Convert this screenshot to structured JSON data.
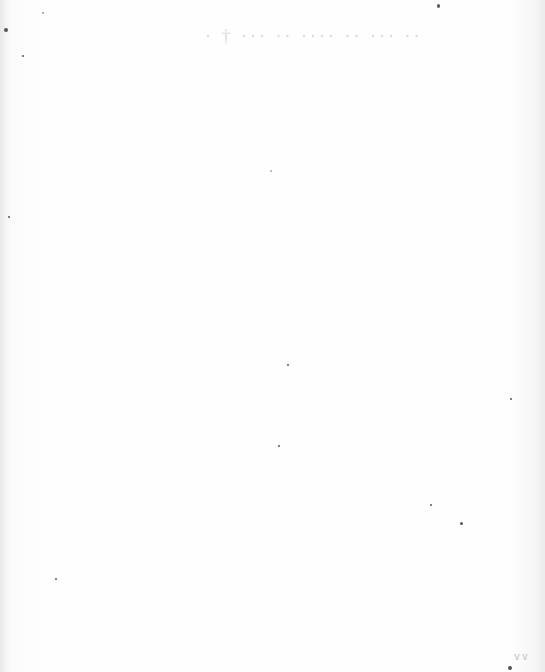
{
  "page": {
    "type": "blank scanned page",
    "bleed_through_text": "· † ··· ·· ···· ·· ··· ··",
    "corner_mark": "∨∨"
  },
  "colors": {
    "paper": "#fdfdfd",
    "edge_shadow": "#e9e9e9"
  }
}
